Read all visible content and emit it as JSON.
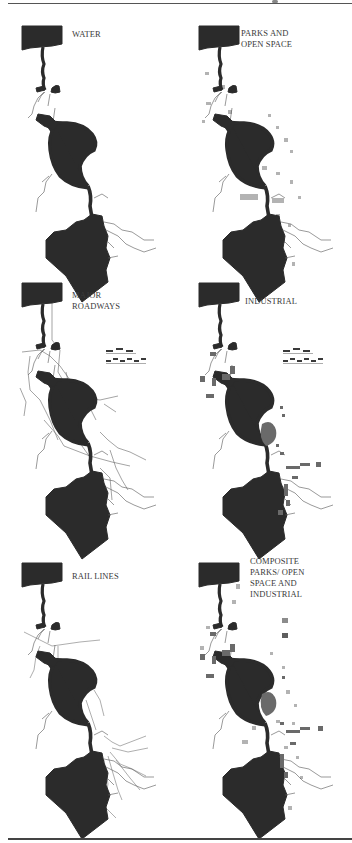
{
  "figure": {
    "panels": [
      {
        "id": "water",
        "label": "WATER"
      },
      {
        "id": "parks",
        "label": "PARKS AND\nOPEN SPACE"
      },
      {
        "id": "roadways",
        "label": "MAJOR\nROADWAYS"
      },
      {
        "id": "industrial",
        "label": "INDUSTRIAL"
      },
      {
        "id": "rail",
        "label": "RAIL LINES"
      },
      {
        "id": "composite",
        "label": "COMPOSITE\nPARKS/ OPEN\nSPACE AND\nINDUSTRIAL"
      }
    ],
    "legend": {
      "roadway_symbols": [
        "dashed-highway-symbol",
        "checkered-highway-symbol"
      ],
      "composite_swatches": [
        {
          "name": "parks-open-space",
          "color": "#8c8c8c"
        },
        {
          "name": "industrial",
          "color": "#5e5e5e"
        }
      ]
    },
    "colors": {
      "water": "#2b2b2b",
      "parks": "#9a9a9a",
      "industrial": "#6a6a6a",
      "lines": "#666666"
    }
  }
}
